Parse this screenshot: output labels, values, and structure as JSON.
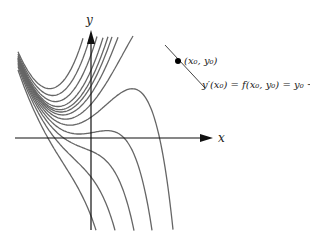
{
  "diagram": {
    "axes": {
      "x_label": "x",
      "y_label": "y"
    },
    "point_label": "(x₀, y₀)",
    "equation_label": "y′(x₀) = f(x₀, y₀) = y₀ − x₀²",
    "ode": "y' = y - x^2",
    "general_solution": "y = x^2 + 2x + 2 + C e^x",
    "curve_constants": [
      3,
      2,
      1.2,
      0.6,
      0.25,
      0,
      -0.3,
      -0.7,
      -1.2,
      -1.8,
      -2.5,
      -3.5,
      -5
    ],
    "colors": {
      "curve": "#666666",
      "axis": "#111111",
      "text": "#222222"
    }
  }
}
